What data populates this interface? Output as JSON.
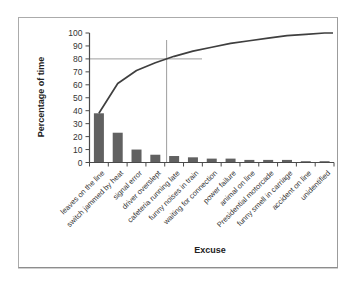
{
  "chart_data": {
    "type": "bar",
    "subtype": "pareto",
    "title": "",
    "xlabel": "Excuse",
    "ylabel": "Percentage of time",
    "categories": [
      "leaves on the line",
      "switch jammed by heat",
      "signal error",
      "driver overslept",
      "cafeteria running late",
      "funny noises in train",
      "waiting for connection",
      "power failure",
      "animal on line",
      "Presidential motorcade",
      "funny smell in carriage",
      "accident on line",
      "unidentified"
    ],
    "series": [
      {
        "name": "Percentage of time",
        "type": "bar",
        "values": [
          38,
          23,
          10,
          6,
          5,
          4,
          3,
          3,
          2,
          2,
          2,
          1,
          1
        ]
      },
      {
        "name": "Cumulative percentage",
        "type": "line",
        "values": [
          38,
          61,
          71,
          77,
          82,
          86,
          89,
          92,
          94,
          96,
          98,
          99,
          100
        ]
      }
    ],
    "ylim": [
      0,
      100
    ],
    "yticks": [
      0,
      10,
      20,
      30,
      40,
      50,
      60,
      70,
      80,
      90,
      100
    ],
    "grid": false,
    "legend": "none",
    "annotations": {
      "reference_value": 80,
      "horizontal_reference_line": true,
      "vertical_reference_line_at_cumulative": 80
    },
    "colors": {
      "bar": "#616161",
      "cumulative_line": "#3f3f3f",
      "reference_line": "#9e9e9e",
      "axis": "#4a4a4a",
      "text": "#343434"
    }
  }
}
